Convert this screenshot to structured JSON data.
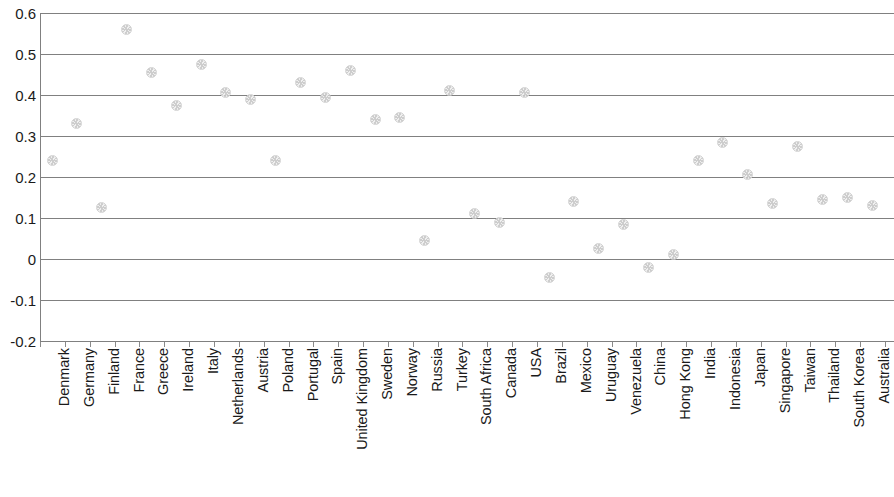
{
  "chart_data": {
    "type": "scatter",
    "title": "",
    "subtitle": "",
    "xlabel": "",
    "ylabel": "",
    "ylim": [
      -0.2,
      0.6
    ],
    "yticks": [
      0.6,
      0.5,
      0.4,
      0.3,
      0.2,
      0.1,
      0,
      -0.1,
      -0.2
    ],
    "ytick_labels": [
      "0.6",
      "0.5",
      "0.4",
      "0.3",
      "0.2",
      "0.1",
      "0",
      "-0.1",
      "-0.2"
    ],
    "grid": true,
    "grid_axis": "y",
    "legend": false,
    "legend_position": "none",
    "marker": {
      "shape": "circle",
      "fill": "#e0e0e0",
      "edge": "#c9c9c9",
      "size": 11
    },
    "categories": [
      "Denmark",
      "Germany",
      "Finland",
      "France",
      "Greece",
      "Ireland",
      "Italy",
      "Netherlands",
      "Austria",
      "Poland",
      "Portugal",
      "Spain",
      "United Kingdom",
      "Sweden",
      "Norway",
      "Russia",
      "Turkey",
      "South Africa",
      "Canada",
      "USA",
      "Brazil",
      "Mexico",
      "Uruguay",
      "Venezuela",
      "China",
      "Hong Kong",
      "India",
      "Indonesia",
      "Japan",
      "Singapore",
      "Taiwan",
      "Thailand",
      "South Korea",
      "Australia"
    ],
    "values": [
      0.24,
      0.33,
      0.125,
      0.56,
      0.455,
      0.375,
      0.475,
      0.405,
      0.39,
      0.24,
      0.43,
      0.395,
      0.46,
      0.34,
      0.345,
      0.045,
      0.41,
      0.11,
      0.09,
      0.405,
      -0.045,
      0.14,
      0.025,
      0.085,
      -0.02,
      0.01,
      0.24,
      0.285,
      0.205,
      0.135,
      0.275,
      0.145,
      0.15,
      0.13
    ],
    "series": [
      {
        "name": "",
        "values": [
          0.24,
          0.33,
          0.125,
          0.56,
          0.455,
          0.375,
          0.475,
          0.405,
          0.39,
          0.24,
          0.43,
          0.395,
          0.46,
          0.34,
          0.345,
          0.045,
          0.41,
          0.11,
          0.09,
          0.405,
          -0.045,
          0.14,
          0.025,
          0.085,
          -0.02,
          0.01,
          0.24,
          0.285,
          0.205,
          0.135,
          0.275,
          0.145,
          0.15,
          0.13
        ]
      }
    ]
  },
  "colors": {
    "grid": "#808080",
    "axis": "#808080",
    "tick": "#8a8a8a",
    "text": "#1a1a1a",
    "marker_fill": "#e0e0e0",
    "background": "#ffffff"
  }
}
